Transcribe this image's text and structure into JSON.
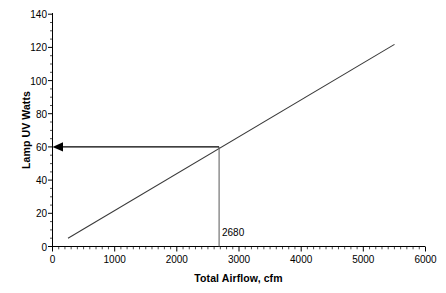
{
  "chart_data": {
    "type": "line",
    "title": "",
    "xlabel": "Total Airflow, cfm",
    "ylabel": "Lamp UV Watts",
    "xlim": [
      0,
      6000
    ],
    "ylim": [
      0,
      140
    ],
    "x_ticks": [
      0,
      1000,
      2000,
      3000,
      4000,
      5000,
      6000
    ],
    "x_tick_labels": [
      "0",
      "1000",
      "2000",
      "3000",
      "4000",
      "5000",
      "6000"
    ],
    "x_minor_tick_interval": 100,
    "y_ticks": [
      0,
      20,
      40,
      60,
      80,
      100,
      120,
      140
    ],
    "y_tick_labels": [
      "0",
      "20",
      "40",
      "60",
      "80",
      "100",
      "120",
      "140"
    ],
    "y_minor_tick_interval": 5,
    "grid": false,
    "legend": null,
    "line_color": "#3a3a3a",
    "axis_color": "#000000",
    "annotation_color": "#555555",
    "series": [
      {
        "name": "Lamp UV Watts vs Total Airflow",
        "x": [
          250,
          5500
        ],
        "y": [
          5,
          122
        ]
      }
    ],
    "annotations": [
      {
        "name": "operating-point",
        "label": "2680",
        "x": 2680,
        "y": 60,
        "drop_line_to_y": 0,
        "arrow_to_x": 0,
        "arrow_direction": "left"
      }
    ]
  },
  "axes": {
    "y_title": "Lamp UV Watts",
    "x_title": "Total Airflow, cfm"
  },
  "labels": {
    "y": [
      "140",
      "120",
      "100",
      "80",
      "60",
      "40",
      "20",
      "0"
    ],
    "x": [
      "0",
      "1000",
      "2000",
      "3000",
      "4000",
      "5000",
      "6000"
    ],
    "callout": "2680"
  }
}
